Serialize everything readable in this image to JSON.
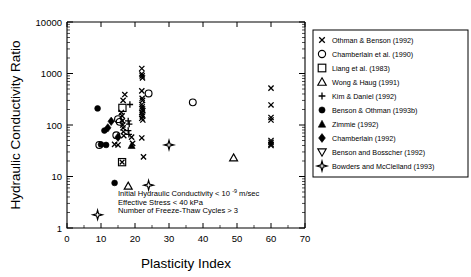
{
  "chart_data": {
    "type": "scatter",
    "title": "",
    "xlabel": "Plasticity Index",
    "ylabel": "Hydraulic Conductivity Ratio",
    "xlim": [
      0,
      70
    ],
    "ylim": [
      1,
      10000
    ],
    "yscale": "log",
    "xscale": "linear",
    "grid": false,
    "xticks": [
      0,
      10,
      20,
      30,
      40,
      50,
      60,
      70
    ],
    "xticklabels": [
      "0",
      "10",
      "20",
      "30",
      "40",
      "50",
      "60",
      "70"
    ],
    "yticks": [
      1,
      10,
      100,
      1000,
      10000
    ],
    "yticklabels": [
      "1",
      "10",
      "100",
      "1000",
      "10000"
    ],
    "legend_position": "right-outside",
    "annotations": [
      {
        "text": "Initial Hydraulic Conductivity < 10",
        "sup": "-9",
        "tail": "m/sec"
      },
      {
        "text": "Effective Stress < 40 kPa",
        "sup": "",
        "tail": ""
      },
      {
        "text": "Number of Freeze-Thaw Cycles > 3",
        "sup": "",
        "tail": ""
      }
    ],
    "series": [
      {
        "name": "Othman & Benson (1992)",
        "marker": "x",
        "points": [
          [
            14.0,
            42
          ],
          [
            15.0,
            41
          ],
          [
            16.5,
            300
          ],
          [
            16.0,
            175
          ],
          [
            16.2,
            150
          ],
          [
            16.3,
            120
          ],
          [
            16.4,
            100
          ],
          [
            16.5,
            88
          ],
          [
            16.6,
            74
          ],
          [
            16.7,
            62
          ],
          [
            17.0,
            390
          ],
          [
            19.0,
            58
          ],
          [
            19.3,
            44
          ],
          [
            22.0,
            1250
          ],
          [
            22.0,
            980
          ],
          [
            22.1,
            900
          ],
          [
            22.2,
            820
          ],
          [
            22.0,
            460
          ],
          [
            22.1,
            330
          ],
          [
            22.2,
            300
          ],
          [
            22.0,
            250
          ],
          [
            22.1,
            225
          ],
          [
            22.2,
            205
          ],
          [
            22.3,
            190
          ],
          [
            22.0,
            175
          ],
          [
            22.1,
            160
          ],
          [
            22.2,
            148
          ],
          [
            22.0,
            135
          ],
          [
            22.3,
            125
          ],
          [
            22.0,
            56
          ],
          [
            22.5,
            24
          ],
          [
            60.0,
            520
          ],
          [
            60.0,
            245
          ],
          [
            60.0,
            140
          ],
          [
            60.0,
            125
          ],
          [
            60.0,
            50
          ],
          [
            60.0,
            46
          ],
          [
            60.0,
            42
          ],
          [
            60.0,
            40
          ]
        ]
      },
      {
        "name": "Chamberlain et al. (1990)",
        "marker": "o",
        "points": [
          [
            9.5,
            41
          ],
          [
            15.0,
            130
          ],
          [
            15.5,
            115
          ],
          [
            14.5,
            63
          ],
          [
            24.0,
            410
          ],
          [
            37.0,
            275
          ]
        ]
      },
      {
        "name": "Liang et al. (1983)",
        "marker": "s",
        "points": [
          [
            16.3,
            215
          ],
          [
            16.2,
            19
          ]
        ]
      },
      {
        "name": "Wong & Haug (1991)",
        "marker": "^open",
        "points": [
          [
            18.0,
            6.5
          ],
          [
            49.0,
            23
          ]
        ]
      },
      {
        "name": "Kim & Daniel (1992)",
        "marker": "+",
        "points": [
          [
            18.5,
            250
          ],
          [
            18.0,
            120
          ],
          [
            18.3,
            104
          ],
          [
            18.0,
            78
          ],
          [
            18.2,
            66
          ]
        ]
      },
      {
        "name": "Benson & Othman (1993b)",
        "marker": "o-fill",
        "points": [
          [
            9.0,
            210
          ],
          [
            11.0,
            78
          ],
          [
            10.0,
            42
          ],
          [
            11.5,
            41
          ],
          [
            14.0,
            7.5
          ]
        ]
      },
      {
        "name": "Zimmie (1992)",
        "marker": "^fill",
        "points": [
          [
            19.0,
            40
          ]
        ]
      },
      {
        "name": "Chamberlain (1992)",
        "marker": "d-fill",
        "points": [
          [
            13.0,
            118
          ],
          [
            12.0,
            88
          ],
          [
            15.0,
            58
          ]
        ]
      },
      {
        "name": "Benson and Bosscher (1992)",
        "marker": "v-open",
        "points": []
      },
      {
        "name": "Bowders and McClelland (1993)",
        "marker": "star4",
        "points": [
          [
            9.0,
            1.8
          ],
          [
            24.0,
            6.8
          ],
          [
            30.0,
            41
          ]
        ]
      }
    ]
  },
  "legend": {
    "items": [
      {
        "label": "Othman & Benson (1992)",
        "marker": "x"
      },
      {
        "label": "Chamberlain et al. (1990)",
        "marker": "o"
      },
      {
        "label": "Liang et al. (1983)",
        "marker": "s"
      },
      {
        "label": "Wong & Haug (1991)",
        "marker": "^open"
      },
      {
        "label": "Kim & Daniel (1992)",
        "marker": "+"
      },
      {
        "label": "Benson & Othman (1993b)",
        "marker": "o-fill"
      },
      {
        "label": "Zimmie (1992)",
        "marker": "^fill"
      },
      {
        "label": "Chamberlain (1992)",
        "marker": "d-fill"
      },
      {
        "label": "Benson and Bosscher (1992)",
        "marker": "v-open"
      },
      {
        "label": "Bowders and McClelland (1993)",
        "marker": "star4"
      }
    ]
  }
}
